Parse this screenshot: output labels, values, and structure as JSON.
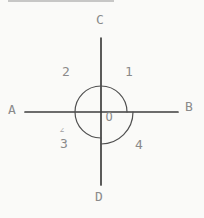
{
  "colors": {
    "background": "#fafaf8",
    "axis": "#3e3e3e",
    "arc": "#4f4f4f",
    "label": "#8a8a8a",
    "artifact": "#a5a5a5"
  },
  "figure": {
    "point_labels": {
      "left": "A",
      "right": "B",
      "top": "C",
      "bottom": "D",
      "center": "O"
    },
    "angle_labels": {
      "q1": "1",
      "q2": "2",
      "q3": "3",
      "q4": "4"
    },
    "angle_mark": "∠"
  }
}
